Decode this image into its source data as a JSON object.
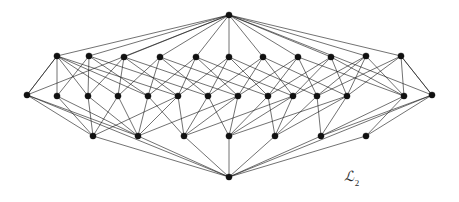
{
  "figure": {
    "name": "lattice-hasse-diagram",
    "caption_symbol": "ℒ",
    "caption_subscript": "2",
    "caption_full": "ℒ2",
    "background_color": "#ffffff",
    "node_color": "#111111",
    "edge_color": "#1a1a1a",
    "node_radius": 3.1,
    "edge_width": 0.62,
    "width": 459,
    "height": 202
  },
  "graph_data": {
    "type": "diagram",
    "description": "Hasse diagram of a lattice drawn in perspective with a top apex, three horizontal ranks of vertices and a bottom apex, connected by many crossing straight edges.",
    "rank_counts": {
      "top_apex": 1,
      "upper_row": 11,
      "middle_row": 14,
      "lower_row": 7,
      "bottom_apex": 1
    },
    "total_nodes": 34,
    "nodes": [
      {
        "id": "T",
        "rank": "top_apex",
        "x": 229,
        "y": 15
      },
      {
        "id": "u0",
        "rank": "upper_row",
        "x": 57,
        "y": 56
      },
      {
        "id": "u1",
        "rank": "upper_row",
        "x": 89,
        "y": 56
      },
      {
        "id": "u2",
        "rank": "upper_row",
        "x": 124,
        "y": 57
      },
      {
        "id": "u3",
        "rank": "upper_row",
        "x": 160,
        "y": 57
      },
      {
        "id": "u4",
        "rank": "upper_row",
        "x": 196,
        "y": 57
      },
      {
        "id": "u5",
        "rank": "upper_row",
        "x": 229,
        "y": 57
      },
      {
        "id": "u6",
        "rank": "upper_row",
        "x": 263,
        "y": 57
      },
      {
        "id": "u7",
        "rank": "upper_row",
        "x": 298,
        "y": 57
      },
      {
        "id": "u8",
        "rank": "upper_row",
        "x": 331,
        "y": 57
      },
      {
        "id": "u9",
        "rank": "upper_row",
        "x": 366,
        "y": 56
      },
      {
        "id": "u10",
        "rank": "upper_row",
        "x": 401,
        "y": 56
      },
      {
        "id": "m0",
        "rank": "middle_row",
        "x": 27,
        "y": 95
      },
      {
        "id": "m1",
        "rank": "middle_row",
        "x": 57,
        "y": 96
      },
      {
        "id": "m2",
        "rank": "middle_row",
        "x": 88,
        "y": 96
      },
      {
        "id": "m3",
        "rank": "middle_row",
        "x": 118,
        "y": 96
      },
      {
        "id": "m4",
        "rank": "middle_row",
        "x": 148,
        "y": 96
      },
      {
        "id": "m5",
        "rank": "middle_row",
        "x": 178,
        "y": 96
      },
      {
        "id": "m6",
        "rank": "middle_row",
        "x": 208,
        "y": 96
      },
      {
        "id": "m7",
        "rank": "middle_row",
        "x": 238,
        "y": 96
      },
      {
        "id": "m8",
        "rank": "middle_row",
        "x": 268,
        "y": 96
      },
      {
        "id": "m9",
        "rank": "middle_row",
        "x": 293,
        "y": 96
      },
      {
        "id": "m10",
        "rank": "middle_row",
        "x": 317,
        "y": 96
      },
      {
        "id": "m11",
        "rank": "middle_row",
        "x": 347,
        "y": 96
      },
      {
        "id": "m12",
        "rank": "middle_row",
        "x": 404,
        "y": 96
      },
      {
        "id": "m13",
        "rank": "middle_row",
        "x": 432,
        "y": 95
      },
      {
        "id": "l0",
        "rank": "lower_row",
        "x": 93,
        "y": 136
      },
      {
        "id": "l1",
        "rank": "lower_row",
        "x": 138,
        "y": 136
      },
      {
        "id": "l2",
        "rank": "lower_row",
        "x": 184,
        "y": 136
      },
      {
        "id": "l3",
        "rank": "lower_row",
        "x": 229,
        "y": 136
      },
      {
        "id": "l4",
        "rank": "lower_row",
        "x": 275,
        "y": 136
      },
      {
        "id": "l5",
        "rank": "lower_row",
        "x": 321,
        "y": 136
      },
      {
        "id": "l6",
        "rank": "lower_row",
        "x": 366,
        "y": 136
      },
      {
        "id": "B",
        "rank": "bottom_apex",
        "x": 229,
        "y": 177
      }
    ],
    "edges": [
      [
        "T",
        "u0"
      ],
      [
        "T",
        "u1"
      ],
      [
        "T",
        "u2"
      ],
      [
        "T",
        "u3"
      ],
      [
        "T",
        "u4"
      ],
      [
        "T",
        "u5"
      ],
      [
        "T",
        "u6"
      ],
      [
        "T",
        "u7"
      ],
      [
        "T",
        "u8"
      ],
      [
        "T",
        "u9"
      ],
      [
        "T",
        "u10"
      ],
      [
        "T",
        "m0"
      ],
      [
        "T",
        "m13"
      ],
      [
        "u0",
        "m0"
      ],
      [
        "u0",
        "m1"
      ],
      [
        "u0",
        "m2"
      ],
      [
        "u0",
        "m3"
      ],
      [
        "u0",
        "m4"
      ],
      [
        "u0",
        "m5"
      ],
      [
        "u1",
        "m1"
      ],
      [
        "u1",
        "m2"
      ],
      [
        "u1",
        "m4"
      ],
      [
        "u1",
        "m6"
      ],
      [
        "u2",
        "m2"
      ],
      [
        "u2",
        "m3"
      ],
      [
        "u2",
        "m5"
      ],
      [
        "u2",
        "m7"
      ],
      [
        "u3",
        "m3"
      ],
      [
        "u3",
        "m4"
      ],
      [
        "u3",
        "m6"
      ],
      [
        "u3",
        "m8"
      ],
      [
        "u4",
        "m4"
      ],
      [
        "u4",
        "m5"
      ],
      [
        "u4",
        "m7"
      ],
      [
        "u4",
        "m9"
      ],
      [
        "u5",
        "m5"
      ],
      [
        "u5",
        "m6"
      ],
      [
        "u5",
        "m8"
      ],
      [
        "u5",
        "m10"
      ],
      [
        "u6",
        "m6"
      ],
      [
        "u6",
        "m7"
      ],
      [
        "u6",
        "m9"
      ],
      [
        "u6",
        "m11"
      ],
      [
        "u7",
        "m7"
      ],
      [
        "u7",
        "m8"
      ],
      [
        "u7",
        "m10"
      ],
      [
        "u7",
        "m12"
      ],
      [
        "u8",
        "m8"
      ],
      [
        "u8",
        "m9"
      ],
      [
        "u8",
        "m11"
      ],
      [
        "u8",
        "m12"
      ],
      [
        "u9",
        "m9"
      ],
      [
        "u9",
        "m10"
      ],
      [
        "u9",
        "m11"
      ],
      [
        "u9",
        "m12"
      ],
      [
        "u10",
        "m10"
      ],
      [
        "u10",
        "m11"
      ],
      [
        "u10",
        "m12"
      ],
      [
        "u10",
        "m13"
      ],
      [
        "u0",
        "m0"
      ],
      [
        "u10",
        "m13"
      ],
      [
        "m0",
        "l0"
      ],
      [
        "m1",
        "l0"
      ],
      [
        "m2",
        "l0"
      ],
      [
        "m2",
        "l1"
      ],
      [
        "m3",
        "l1"
      ],
      [
        "m4",
        "l1"
      ],
      [
        "m4",
        "l2"
      ],
      [
        "m5",
        "l1"
      ],
      [
        "m5",
        "l2"
      ],
      [
        "m6",
        "l2"
      ],
      [
        "m6",
        "l3"
      ],
      [
        "m7",
        "l2"
      ],
      [
        "m7",
        "l3"
      ],
      [
        "m8",
        "l3"
      ],
      [
        "m8",
        "l4"
      ],
      [
        "m9",
        "l3"
      ],
      [
        "m9",
        "l4"
      ],
      [
        "m10",
        "l4"
      ],
      [
        "m10",
        "l5"
      ],
      [
        "m11",
        "l4"
      ],
      [
        "m11",
        "l5"
      ],
      [
        "m12",
        "l5"
      ],
      [
        "m12",
        "l6"
      ],
      [
        "m13",
        "l6"
      ],
      [
        "m0",
        "l1"
      ],
      [
        "m13",
        "l5"
      ],
      [
        "m1",
        "l1"
      ],
      [
        "m3",
        "l0"
      ],
      [
        "m5",
        "l0"
      ],
      [
        "m7",
        "l1"
      ],
      [
        "m9",
        "l2"
      ],
      [
        "m11",
        "l3"
      ],
      [
        "l0",
        "B"
      ],
      [
        "l1",
        "B"
      ],
      [
        "l2",
        "B"
      ],
      [
        "l3",
        "B"
      ],
      [
        "l4",
        "B"
      ],
      [
        "l5",
        "B"
      ],
      [
        "l6",
        "B"
      ],
      [
        "m0",
        "B"
      ],
      [
        "m13",
        "B"
      ]
    ]
  }
}
